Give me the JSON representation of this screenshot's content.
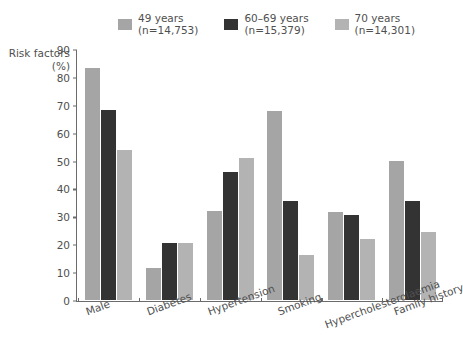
{
  "chart_data": {
    "type": "bar",
    "title": "",
    "xlabel": "",
    "ylabel": "Risk factors (%)",
    "ylabel_line1": "Risk factors",
    "ylabel_line2": "(%)",
    "ylim": [
      0,
      90
    ],
    "ytick_step": 10,
    "yticks": [
      90,
      80,
      70,
      60,
      50,
      40,
      30,
      20,
      10,
      0
    ],
    "grid": false,
    "legend_position": "top",
    "categories": [
      "Male",
      "Diabetes",
      "Hypertension",
      "Smoking",
      "Hypercholesterolaemia",
      "Family history"
    ],
    "series": [
      {
        "name": "49 years",
        "label_line1": "49 years",
        "label_line2": "(n=14,753)",
        "n": "14,753",
        "color": "#a5a5a5",
        "values": [
          83.5,
          11.5,
          32,
          68,
          31.5,
          50
        ]
      },
      {
        "name": "60-69 years",
        "label_line1": "60–69 years",
        "label_line2": "(n=15,379)",
        "n": "15,379",
        "color": "#333333",
        "values": [
          68.5,
          20.5,
          46,
          35.5,
          30.5,
          35.5
        ]
      },
      {
        "name": "70 years",
        "label_line1": "70 years",
        "label_line2": "(n=14,301)",
        "n": "14,301",
        "color": "#b3b3b3",
        "values": [
          54,
          20.5,
          51,
          16,
          22,
          24.5
        ]
      }
    ]
  },
  "colors": {
    "axis": "#6b6b6b",
    "text": "#4f4f4f",
    "background": "#ffffff"
  }
}
